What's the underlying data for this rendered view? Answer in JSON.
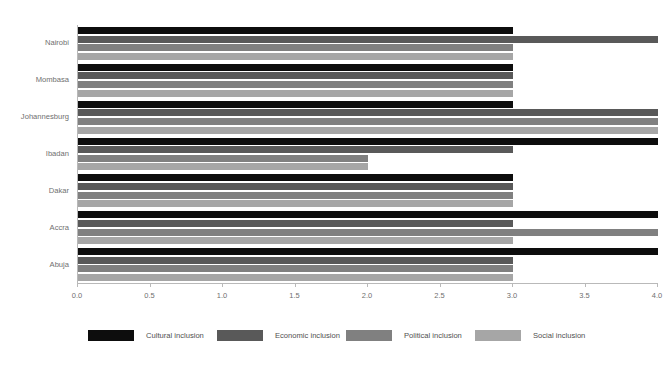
{
  "chart_data": {
    "type": "bar",
    "orientation": "horizontal",
    "title": "FIGURE 1. CULTURAL, ECONOMIC, POLITICAL AND SOCIAL INCLUSIVENESS OF SELECTED AFRICAN CITIES",
    "xlabel": "",
    "ylabel": "",
    "xlim": [
      0.0,
      4.0
    ],
    "xticks": [
      "0.0",
      "0.5",
      "1.0",
      "1.5",
      "2.0",
      "2.5",
      "3.0",
      "3.5",
      "4.0"
    ],
    "xtick_values": [
      0.0,
      0.5,
      1.0,
      1.5,
      2.0,
      2.5,
      3.0,
      3.5,
      4.0
    ],
    "grid": false,
    "legend_position": "bottom",
    "categories": [
      "Nairobi",
      "Mombasa",
      "Johannesburg",
      "Ibadan",
      "Dakar",
      "Accra",
      "Abuja"
    ],
    "series": [
      {
        "name": "Cultural inclusion",
        "color": "#0d0d0d",
        "values": [
          3.0,
          3.0,
          3.0,
          4.0,
          3.0,
          4.0,
          4.0
        ]
      },
      {
        "name": "Economic inclusion",
        "color": "#595959",
        "values": [
          4.0,
          3.0,
          4.0,
          3.0,
          3.0,
          3.0,
          3.0
        ]
      },
      {
        "name": "Political inclusion",
        "color": "#808080",
        "values": [
          3.0,
          3.0,
          4.0,
          2.0,
          3.0,
          4.0,
          3.0
        ]
      },
      {
        "name": "Social inclusion",
        "color": "#a6a6a6",
        "values": [
          3.0,
          3.0,
          4.0,
          2.0,
          3.0,
          3.0,
          3.0
        ]
      }
    ]
  },
  "axis": {
    "line_color": "#b9b9b9",
    "tick_label_color": "#6f6f6f"
  }
}
